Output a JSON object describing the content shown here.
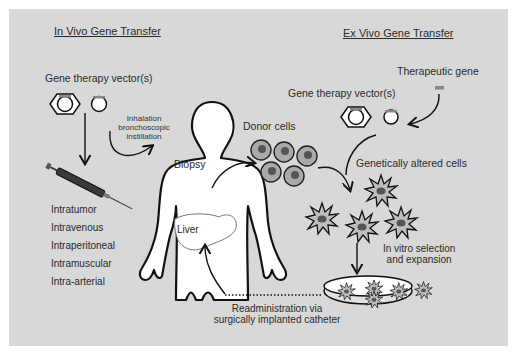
{
  "in_vivo": {
    "title": "In Vivo Gene Transfer",
    "vectors_label": "Gene therapy vector(s)",
    "inhalation_label": [
      "Inhalation",
      "bronchoscopic",
      "instillation"
    ],
    "routes": [
      "Intratumor",
      "Intravenous",
      "Intraperitoneal",
      "Intramuscular",
      "Intra-arterial"
    ]
  },
  "body": {
    "biopsy_label": "Biopsy",
    "organ_label": "Liver"
  },
  "ex_vivo": {
    "title": "Ex Vivo Gene Transfer",
    "therapeutic_gene_label": "Therapeutic gene",
    "vectors_label": "Gene therapy vector(s)",
    "donor_cells_label": "Donor cells",
    "altered_cells_label": "Genetically altered cells",
    "selection_label": [
      "In vitro selection",
      "and expansion"
    ],
    "readministration_label": [
      "Readministration via",
      "surgically implanted catheter"
    ]
  },
  "colors": {
    "background": "#d8d8d8",
    "line": "#111111",
    "cell_fill": "#a8a8a8",
    "nucleus": "#555555",
    "figure_fill": "#ffffff"
  }
}
